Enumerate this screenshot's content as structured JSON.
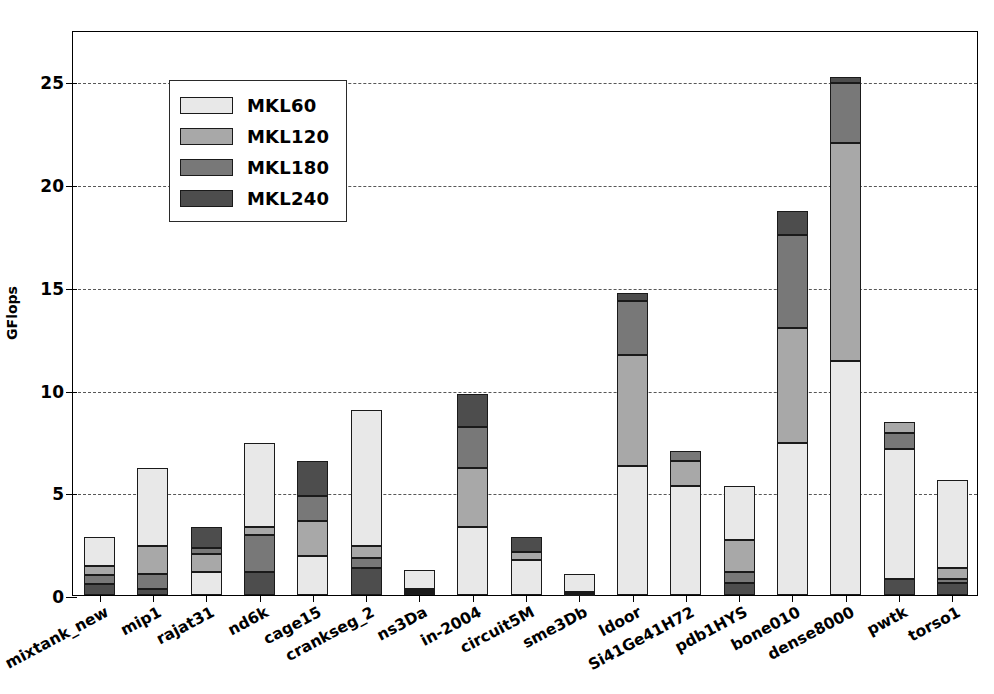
{
  "chart_data": {
    "type": "bar",
    "subtype": "stacked-vertical",
    "title": "",
    "xlabel": "",
    "ylabel": "GFlops",
    "ylim": [
      0,
      27.5
    ],
    "yticks": [
      0,
      5,
      10,
      15,
      20,
      25
    ],
    "ytick_labels": [
      "0",
      "5",
      "10",
      "15",
      "20",
      "25"
    ],
    "grid": "horizontal-dashed",
    "legend_position": "upper-left",
    "stacked": true,
    "categories": [
      "mixtank_new",
      "mip1",
      "rajat31",
      "nd6k",
      "cage15",
      "crankseg_2",
      "ns3Da",
      "in-2004",
      "circuit5M",
      "sme3Db",
      "ldoor",
      "Si41Ge41H72",
      "pdb1HYS",
      "bone010",
      "dense8000",
      "pwtk",
      "torso1"
    ],
    "series": [
      {
        "name": "MKL60",
        "color": "#e8e8e8",
        "values": [
          1.4,
          3.8,
          1.1,
          4.1,
          1.9,
          6.6,
          0.9,
          3.3,
          1.7,
          0.85,
          6.3,
          5.3,
          2.6,
          7.4,
          11.4,
          6.3,
          4.3
        ]
      },
      {
        "name": "MKL120",
        "color": "#a8a8a8",
        "values": [
          0.45,
          1.4,
          0.9,
          0.4,
          1.7,
          0.6,
          0.1,
          2.9,
          0.4,
          0.05,
          5.4,
          1.2,
          1.6,
          5.6,
          10.6,
          0.5,
          0.5
        ]
      },
      {
        "name": "MKL180",
        "color": "#787878",
        "values": [
          0.4,
          0.7,
          0.3,
          1.8,
          1.2,
          0.5,
          0.1,
          2.0,
          0.0,
          0.05,
          2.6,
          0.5,
          0.5,
          4.5,
          2.9,
          0.8,
          0.2
        ]
      },
      {
        "name": "MKL240",
        "color": "#4d4d4d",
        "values": [
          0.55,
          0.3,
          1.0,
          1.1,
          1.7,
          1.3,
          0.1,
          1.6,
          0.7,
          0.05,
          0.4,
          0.0,
          0.6,
          1.2,
          0.3,
          0.8,
          0.6
        ]
      }
    ],
    "stack_order": [
      [
        "MKL240",
        "MKL180",
        "MKL120",
        "MKL60"
      ],
      [
        "MKL240",
        "MKL180",
        "MKL120",
        "MKL60"
      ],
      [
        "MKL60",
        "MKL120",
        "MKL180",
        "MKL240"
      ],
      [
        "MKL240",
        "MKL180",
        "MKL120",
        "MKL60"
      ],
      [
        "MKL60",
        "MKL120",
        "MKL180",
        "MKL240"
      ],
      [
        "MKL240",
        "MKL180",
        "MKL120",
        "MKL60"
      ],
      [
        "MKL240",
        "MKL180",
        "MKL120",
        "MKL60"
      ],
      [
        "MKL60",
        "MKL120",
        "MKL180",
        "MKL240"
      ],
      [
        "MKL60",
        "MKL120",
        "MKL180",
        "MKL240"
      ],
      [
        "MKL240",
        "MKL180",
        "MKL120",
        "MKL60"
      ],
      [
        "MKL60",
        "MKL120",
        "MKL180",
        "MKL240"
      ],
      [
        "MKL60",
        "MKL120",
        "MKL180",
        "MKL240"
      ],
      [
        "MKL240",
        "MKL180",
        "MKL120",
        "MKL60"
      ],
      [
        "MKL60",
        "MKL120",
        "MKL180",
        "MKL240"
      ],
      [
        "MKL60",
        "MKL120",
        "MKL180",
        "MKL240"
      ],
      [
        "MKL240",
        "MKL60",
        "MKL180",
        "MKL120"
      ],
      [
        "MKL240",
        "MKL180",
        "MKL120",
        "MKL60"
      ]
    ],
    "totals": [
      2.8,
      6.2,
      3.3,
      7.4,
      6.5,
      9.0,
      1.2,
      9.8,
      2.8,
      1.0,
      14.7,
      7.0,
      5.3,
      18.7,
      25.2,
      8.4,
      5.6
    ]
  },
  "legend": {
    "entries": [
      {
        "label": "MKL60",
        "color": "#e8e8e8"
      },
      {
        "label": "MKL120",
        "color": "#a8a8a8"
      },
      {
        "label": "MKL180",
        "color": "#787878"
      },
      {
        "label": "MKL240",
        "color": "#4d4d4d"
      }
    ]
  }
}
